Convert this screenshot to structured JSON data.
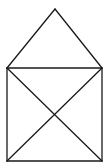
{
  "diagram": {
    "stroke_color": "#1a1a1a",
    "background": "#ffffff",
    "points": {
      "apex": [
        55,
        9
      ],
      "top_left": [
        7,
        68
      ],
      "top_right": [
        102,
        68
      ],
      "bottom_left": [
        7,
        161
      ],
      "bottom_right": [
        102,
        161
      ]
    },
    "segments": [
      {
        "name": "roof-left",
        "from": "apex",
        "to": "top_left"
      },
      {
        "name": "roof-right",
        "from": "apex",
        "to": "top_right"
      },
      {
        "name": "square-top",
        "from": "top_left",
        "to": "top_right"
      },
      {
        "name": "square-left",
        "from": "top_left",
        "to": "bottom_left"
      },
      {
        "name": "square-right",
        "from": "top_right",
        "to": "bottom_right"
      },
      {
        "name": "square-bottom",
        "from": "bottom_left",
        "to": "bottom_right"
      },
      {
        "name": "diagonal-1",
        "from": "top_left",
        "to": "bottom_right"
      },
      {
        "name": "diagonal-2",
        "from": "top_right",
        "to": "bottom_left"
      }
    ]
  }
}
